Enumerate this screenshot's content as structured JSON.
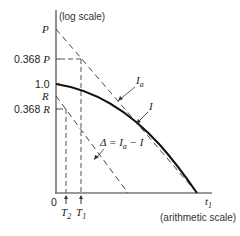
{
  "diagram": {
    "y_axis_label": "(log scale)",
    "x_axis_label": "(arithmetic scale)",
    "y_ticks": {
      "P": "P",
      "p368": "0.368 P",
      "one": "1.0",
      "R": "R",
      "r368": "0.368 R"
    },
    "origin": "0",
    "x_marks": {
      "T2": "T",
      "T2_sub": "2",
      "T1": "T",
      "T1_sub": "1",
      "t1": "t",
      "t1_sub": "1"
    },
    "curves": {
      "Ia": "I",
      "Ia_sub": "a",
      "I": "I",
      "delta": "Δ = I",
      "delta_sub": "a",
      "delta_tail": " − I"
    }
  }
}
